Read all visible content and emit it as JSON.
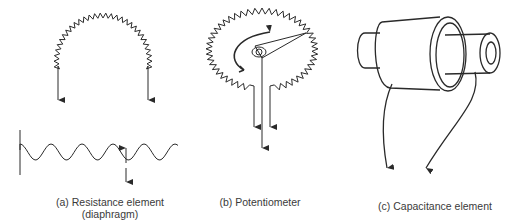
{
  "figure": {
    "panels": [
      {
        "id": "a",
        "caption_line1": "(a) Resistance element",
        "caption_line2": "(diaphragm)",
        "components": [
          "resistive-coil-arc",
          "terminal-arrows",
          "corrugated-diaphragm",
          "displacement-arrows"
        ]
      },
      {
        "id": "b",
        "caption_line1": "(b) Potentiometer",
        "components": [
          "resistive-coil-ring",
          "wiper-arm",
          "rotation-arrow",
          "terminal-arrows"
        ]
      },
      {
        "id": "c",
        "caption_line1": "(c) Capacitance element",
        "components": [
          "outer-cylinder",
          "inner-cylinder",
          "lead-wires"
        ]
      }
    ],
    "stroke_color": "#2a2a2a",
    "caption_color": "#3a3a3a"
  }
}
